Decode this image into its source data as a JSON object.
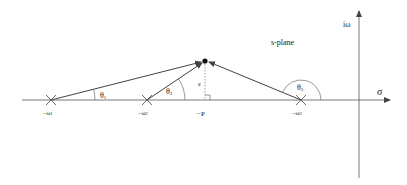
{
  "title": "s-plane",
  "axes": {
    "real_label": "σ",
    "imag_label": "iω"
  },
  "poles": [
    {
      "label": "−ω",
      "sub": "1",
      "x": 51
    },
    {
      "label": "−ω",
      "sub": "2",
      "x": 147
    },
    {
      "label": "−ω",
      "sub": "3",
      "x": 301
    }
  ],
  "point": {
    "x": 205,
    "y": 61
  },
  "foot_label": "−P",
  "height_label": "ε",
  "angles": [
    {
      "label": "θ",
      "sub": "1"
    },
    {
      "label": "θ",
      "sub": "2"
    },
    {
      "label": "θ",
      "sub": "3"
    }
  ],
  "colors": {
    "line": "#444444",
    "dashed": "#777777",
    "point": "#111111"
  }
}
